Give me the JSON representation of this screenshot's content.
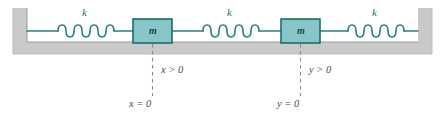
{
  "figure": {
    "type": "physics-diagram",
    "background_color": "#ffffff",
    "support": {
      "color": "#c9c9c9",
      "edge_color": "#8f8f8f",
      "shape": "u-channel"
    },
    "spring_color": "#2b7d7f",
    "block_fill": "#86c6c6",
    "block_border": "#1e6b6e",
    "dashed_line_color": "#8a8a8a"
  },
  "springs": [
    {
      "id": "spring-left",
      "label": "k",
      "coils": 6
    },
    {
      "id": "spring-middle",
      "label": "k",
      "coils": 6
    },
    {
      "id": "spring-right",
      "label": "k",
      "coils": 6
    }
  ],
  "masses": [
    {
      "id": "mass-left",
      "label": "m",
      "displacement_label": "x > 0",
      "origin_label": "x = 0"
    },
    {
      "id": "mass-right",
      "label": "m",
      "displacement_label": "y > 0",
      "origin_label": "y = 0"
    }
  ],
  "labels": {
    "k_left": "k",
    "k_middle": "k",
    "k_right": "k",
    "m_left": "m",
    "m_right": "m",
    "x_positive": "x > 0",
    "x_zero": "x = 0",
    "y_positive": "y > 0",
    "y_zero": "y = 0"
  }
}
